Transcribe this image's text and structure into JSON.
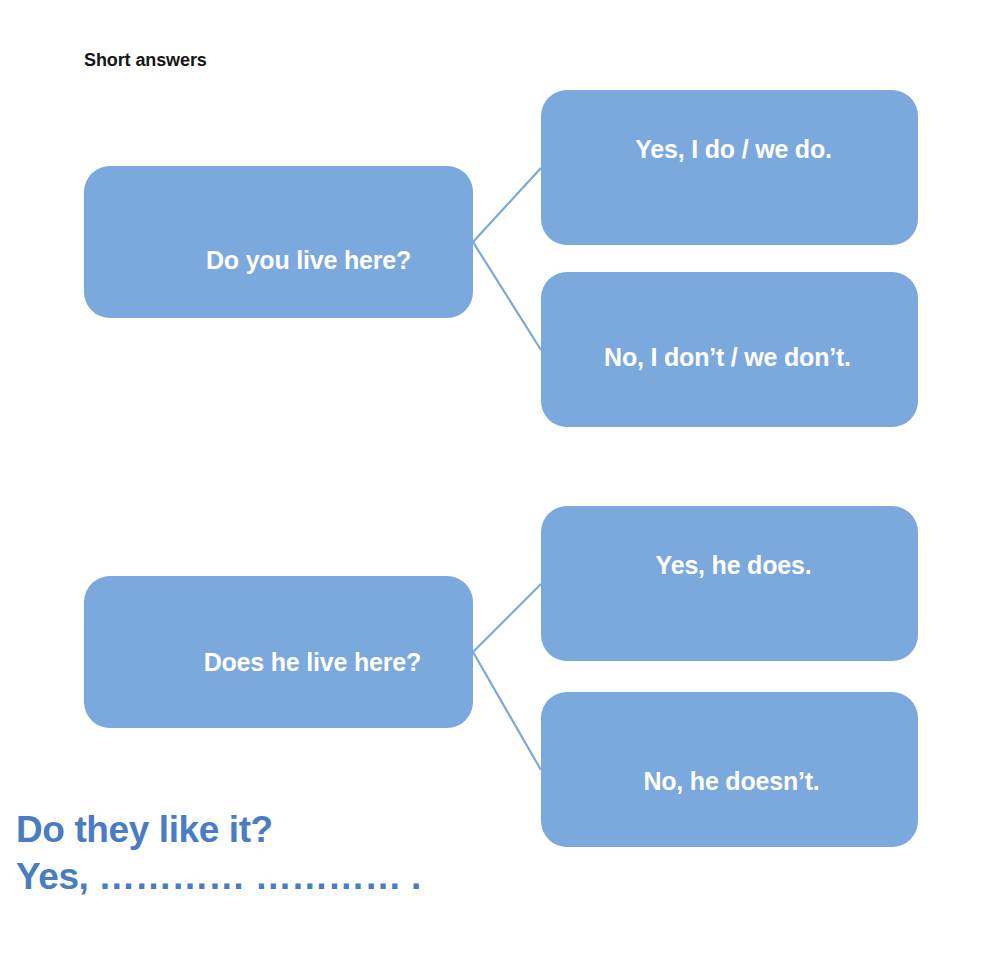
{
  "page": {
    "title": "Short answers",
    "background_color": "#ffffff"
  },
  "colors": {
    "box_blue": "#7ba8dd",
    "box_text": "#ffffff",
    "connector_line": "#7ba8dd",
    "heading_text": "#161616",
    "prompt_blue": "#4a7cc4"
  },
  "diagrams": [
    {
      "id": "group-1",
      "question": "Do you live here?",
      "answers": [
        {
          "id": "affirmative",
          "text": "Yes, I do / we do."
        },
        {
          "id": "negative",
          "text": "No, I don’t / we don’t."
        }
      ]
    },
    {
      "id": "group-2",
      "question": "Does he live here?",
      "answers": [
        {
          "id": "affirmative",
          "text": "Yes, he does."
        },
        {
          "id": "negative",
          "text": "No, he doesn’t."
        }
      ]
    }
  ],
  "prompt": {
    "line1": "Do they like it?",
    "line2": "Yes, ………… ………… ."
  }
}
